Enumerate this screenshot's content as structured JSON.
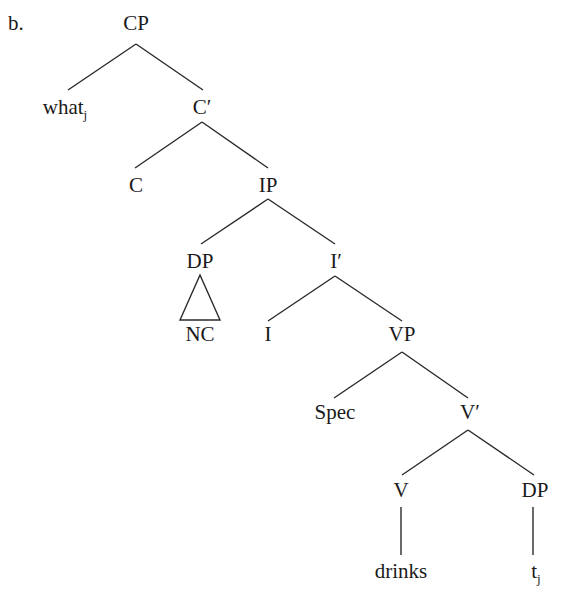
{
  "example_label": "b.",
  "nodes": {
    "cp": "CP",
    "what": "what",
    "what_index": "j",
    "c_bar": "C′",
    "c": "C",
    "ip": "IP",
    "dp_subj": "DP",
    "nc": "NC",
    "i_bar": "I′",
    "i": "I",
    "vp": "VP",
    "spec": "Spec",
    "v_bar": "V′",
    "v": "V",
    "dp_obj": "DP",
    "drinks": "drinks",
    "trace": "t",
    "trace_index": "j"
  }
}
